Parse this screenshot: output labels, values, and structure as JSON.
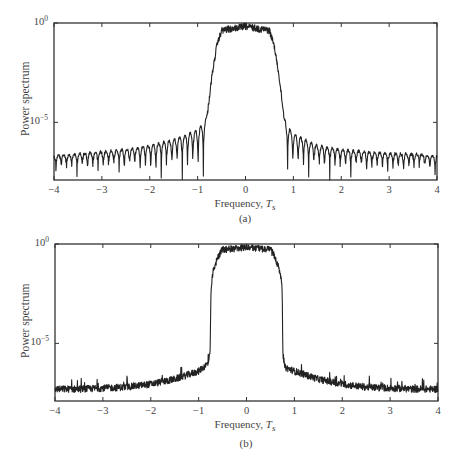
{
  "panels": [
    {
      "id": "a",
      "caption": "(a)",
      "ylabel": "Power spectrum",
      "xlabel_text": "Frequency, ",
      "xlabel_var": "T",
      "xlabel_sub": "s",
      "yticks": [
        {
          "base": "10",
          "exp": "0"
        },
        {
          "base": "10",
          "exp": "−5"
        }
      ],
      "xticks": [
        "−4",
        "−3",
        "−2",
        "−1",
        "0",
        "1",
        "2",
        "3",
        "4"
      ]
    },
    {
      "id": "b",
      "caption": "(b)",
      "ylabel": "Power spectrum",
      "xlabel_text": "Frequency, ",
      "xlabel_var": "T",
      "xlabel_sub": "s",
      "yticks": [
        {
          "base": "10",
          "exp": "0"
        },
        {
          "base": "10",
          "exp": "−5"
        }
      ],
      "xticks": [
        "−4",
        "−3",
        "−2",
        "−1",
        "0",
        "1",
        "2",
        "3",
        "4"
      ]
    }
  ],
  "chart_data": [
    {
      "type": "line",
      "title": "(a)",
      "xlabel": "Frequency, T_s",
      "ylabel": "Power spectrum",
      "xlim": [
        -4,
        4
      ],
      "ylim_log10": [
        -7.9,
        0
      ],
      "yscale": "log",
      "grid": false,
      "legend": null,
      "description": "Spectrum with passband near 10^0 from about -0.5 to 0.5, steep rolloff to about ±0.8, and strongly oscillating sidelobes (nulls) outside the band",
      "series": [
        {
          "name": "power spectrum (a)",
          "x": [
            -4,
            -3.5,
            -3,
            -2.5,
            -2,
            -1.5,
            -1,
            -0.85,
            -0.8,
            -0.7,
            -0.6,
            -0.5,
            0,
            0.5,
            0.6,
            0.7,
            0.8,
            0.85,
            1,
            1.5,
            2,
            2.5,
            3,
            3.5,
            4
          ],
          "log10_y_envelope_peak": [
            -6.6,
            -6.5,
            -6.4,
            -6.3,
            -6.1,
            -5.8,
            -5.3,
            -4.9,
            -4.5,
            -2.5,
            -1.0,
            -0.2,
            0,
            -0.2,
            -1.0,
            -2.5,
            -4.5,
            -5.0,
            -5.5,
            -6.1,
            -6.3,
            -6.4,
            -6.5,
            -6.5,
            -6.6
          ],
          "log10_y_nulls": -7.8,
          "ripple_period": 0.11
        }
      ]
    },
    {
      "type": "line",
      "title": "(b)",
      "xlabel": "Frequency, T_s",
      "ylabel": "Power spectrum",
      "xlim": [
        -4,
        4
      ],
      "ylim_log10": [
        -7.9,
        0
      ],
      "yscale": "log",
      "grid": false,
      "legend": null,
      "description": "Spectrum with passband near 10^0, very steep edges at about ±0.75, and low noisy floor outside the band without deep nulls",
      "series": [
        {
          "name": "power spectrum (b)",
          "x": [
            -4,
            -3.5,
            -3,
            -2.5,
            -2,
            -1.5,
            -1,
            -0.8,
            -0.76,
            -0.74,
            -0.7,
            -0.6,
            -0.5,
            0,
            0.5,
            0.6,
            0.7,
            0.74,
            0.76,
            0.8,
            1,
            1.5,
            2,
            2.5,
            3,
            3.5,
            4
          ],
          "log10_y": [
            -7.3,
            -7.3,
            -7.25,
            -7.2,
            -7.05,
            -6.8,
            -6.4,
            -6.0,
            -5.5,
            -2.0,
            -1.2,
            -0.5,
            -0.1,
            0,
            -0.1,
            -0.5,
            -1.2,
            -2.0,
            -5.5,
            -6.2,
            -6.4,
            -6.8,
            -7.05,
            -7.2,
            -7.25,
            -7.3,
            -7.3
          ]
        }
      ]
    }
  ],
  "render": {
    "line_color": "#222222",
    "axis_color": "#333333",
    "frames": [
      {
        "left": 54,
        "top": 23,
        "right": 437,
        "bottom": 180
      },
      {
        "left": 55,
        "top": 14,
        "right": 438,
        "bottom": 171
      }
    ]
  }
}
